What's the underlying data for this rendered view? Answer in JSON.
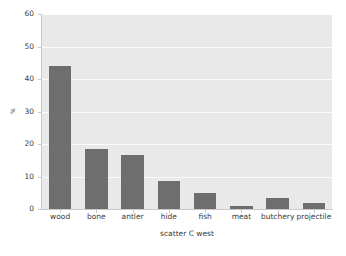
{
  "chart_data": {
    "type": "bar",
    "title": "",
    "subtitle": "",
    "xlabel": "scatter C west",
    "ylabel": "%",
    "categories": [
      "wood",
      "bone",
      "antler",
      "hide",
      "fish",
      "meat",
      "butchery",
      "projectile"
    ],
    "values": [
      44,
      18.5,
      16.5,
      8.5,
      5,
      1,
      3.5,
      2
    ],
    "series": [
      {
        "name": "scatter C west",
        "values": [
          44,
          18.5,
          16.5,
          8.5,
          5,
          1,
          3.5,
          2
        ]
      }
    ],
    "ylim": [
      0,
      60
    ],
    "yticks": [
      0,
      10,
      20,
      30,
      40,
      50,
      60
    ],
    "ytick_labels": [
      "0",
      "10",
      "20",
      "30",
      "40",
      "50",
      "60"
    ],
    "xtick_labels": [
      "wood",
      "bone",
      "antler",
      "hide",
      "fish",
      "meat",
      "butchery",
      "projectile"
    ],
    "grid": true,
    "grid_axis": "y",
    "legend": false,
    "legend_position": "none",
    "bar_color": "#6e6e6e",
    "plot_background_color": "#e9e9e9",
    "figure_background_color": "#ffffff",
    "gridline_color": "#fbfbfb",
    "axis_color": "#c9c9c9",
    "text_color": "#3a3a3a"
  }
}
